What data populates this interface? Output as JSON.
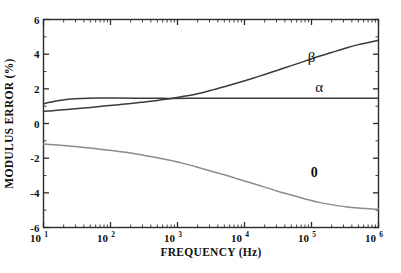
{
  "chart_data": {
    "type": "line",
    "title": "",
    "xlabel": "FREQUENCY (Hz)",
    "ylabel": "MODULUS ERROR (%)",
    "xscale": "log",
    "xlim": [
      10,
      1000000
    ],
    "ylim": [
      -6,
      6
    ],
    "grid": false,
    "legend": "inline-annotations",
    "xticks": [
      {
        "value": 10,
        "mantissa": "10",
        "exponent": "1"
      },
      {
        "value": 100,
        "mantissa": "10",
        "exponent": "2"
      },
      {
        "value": 1000,
        "mantissa": "10",
        "exponent": "3"
      },
      {
        "value": 10000,
        "mantissa": "10",
        "exponent": "4"
      },
      {
        "value": 100000,
        "mantissa": "10",
        "exponent": "5"
      },
      {
        "value": 1000000,
        "mantissa": "10",
        "exponent": "6"
      }
    ],
    "yticks": [
      6,
      4,
      2,
      0,
      -2,
      -4,
      -6
    ],
    "ytick_labels": [
      "6",
      "4",
      "2",
      "0",
      "-2",
      "-4",
      "-6"
    ],
    "series": [
      {
        "name": "beta",
        "label": "β",
        "color": "#3a3a3a",
        "label_x": 100000,
        "label_y": 3.55,
        "x": [
          10,
          14,
          20,
          30,
          50,
          80,
          120,
          200,
          320,
          500,
          800,
          1300,
          2000,
          3200,
          5000,
          8000,
          13000,
          20000,
          32000,
          50000,
          80000,
          130000,
          200000,
          320000,
          500000,
          800000,
          1000000
        ],
        "y": [
          0.7,
          0.74,
          0.79,
          0.85,
          0.93,
          1.01,
          1.07,
          1.15,
          1.24,
          1.33,
          1.44,
          1.58,
          1.72,
          1.92,
          2.12,
          2.35,
          2.6,
          2.83,
          3.09,
          3.34,
          3.6,
          3.88,
          4.1,
          4.34,
          4.55,
          4.72,
          4.8
        ]
      },
      {
        "name": "alpha",
        "label": "α",
        "color": "#3a3a3a",
        "label_x": 130000,
        "label_y": 1.8,
        "x": [
          10,
          13,
          17,
          22,
          30,
          45,
          70,
          120,
          250,
          600,
          1500,
          5000,
          20000,
          100000,
          400000,
          1000000
        ],
        "y": [
          1.14,
          1.24,
          1.33,
          1.39,
          1.43,
          1.46,
          1.47,
          1.47,
          1.46,
          1.45,
          1.45,
          1.45,
          1.45,
          1.45,
          1.45,
          1.45
        ]
      },
      {
        "name": "zero",
        "label": "0",
        "color": "#8c8c8c",
        "label_x": 110000,
        "label_y": -3.1,
        "x": [
          10,
          14,
          20,
          30,
          50,
          80,
          120,
          200,
          320,
          500,
          800,
          1300,
          2000,
          3200,
          5000,
          8000,
          13000,
          20000,
          32000,
          50000,
          80000,
          130000,
          200000,
          320000,
          500000,
          800000,
          1000000
        ],
        "y": [
          -1.18,
          -1.22,
          -1.27,
          -1.33,
          -1.42,
          -1.51,
          -1.59,
          -1.7,
          -1.84,
          -1.98,
          -2.14,
          -2.33,
          -2.52,
          -2.75,
          -2.96,
          -3.2,
          -3.45,
          -3.67,
          -3.92,
          -4.13,
          -4.35,
          -4.55,
          -4.68,
          -4.8,
          -4.88,
          -4.93,
          -4.95
        ]
      }
    ]
  },
  "axes": {
    "frame_color": "#2b2b2b"
  }
}
